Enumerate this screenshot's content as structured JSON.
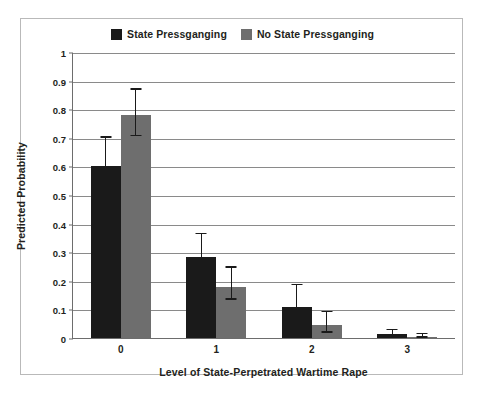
{
  "chart_data": {
    "type": "bar",
    "title": "",
    "subtitle": "",
    "xlabel": "Level of State-Perpetrated Wartime Rape",
    "ylabel": "Predicted Probability",
    "categories": [
      "0",
      "1",
      "2",
      "3"
    ],
    "ylim": [
      0,
      1
    ],
    "yticks": [
      "0",
      "0.1",
      "0.2",
      "0.3",
      "0.4",
      "0.5",
      "0.6",
      "0.7",
      "0.8",
      "0.9",
      "1"
    ],
    "ytick_values": [
      0,
      0.1,
      0.2,
      0.3,
      0.4,
      0.5,
      0.6,
      0.7,
      0.8,
      0.9,
      1
    ],
    "grid": "horizontal",
    "legend_position": "top-center",
    "series": [
      {
        "name": "State Pressganging",
        "color": "#1a1a1a",
        "values": [
          0.6,
          0.285,
          0.11,
          0.013
        ],
        "error_low": [
          0.51,
          0.212,
          0.055,
          0.004
        ],
        "error_high": [
          0.7,
          0.362,
          0.185,
          0.027
        ]
      },
      {
        "name": "No State Pressganging",
        "color": "#6e6e6e",
        "values": [
          0.78,
          0.18,
          0.045,
          0.005
        ],
        "error_low": [
          0.705,
          0.133,
          0.018,
          0.001
        ],
        "error_high": [
          0.868,
          0.245,
          0.09,
          0.013
        ]
      }
    ]
  },
  "legend": {
    "entries": [
      {
        "label": "State Pressganging",
        "color": "#1a1a1a"
      },
      {
        "label": "No State Pressganging",
        "color": "#6e6e6e"
      }
    ]
  },
  "colors": {
    "series_dark": "#1a1a1a",
    "series_gray": "#6e6e6e",
    "grid": "#8a8a8a",
    "axis": "#6d6d6d",
    "frame": "#b9b9b9",
    "text": "#231f20",
    "background": "#ffffff"
  }
}
